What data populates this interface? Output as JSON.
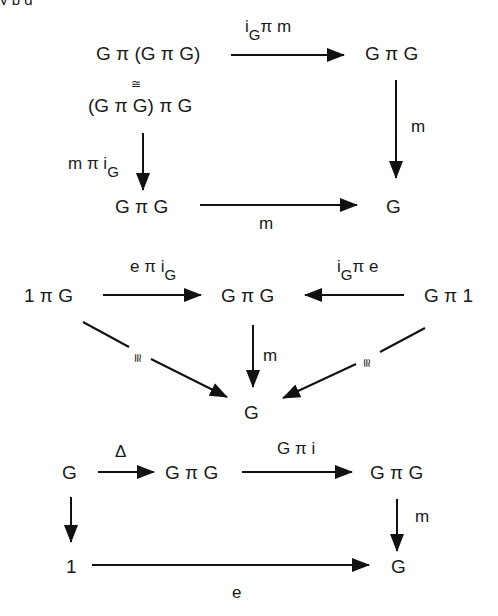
{
  "clipped_header_text": "y  p                                    g",
  "diagrams": [
    {
      "name": "associativity",
      "nodes": {
        "top_left": "G π (G π G)",
        "iso_symbol": "≅",
        "top_left_alt": "(G π G) π G",
        "top_right": "G π G",
        "bottom_left": "G π G",
        "bottom_right": "G"
      },
      "labels": {
        "top_arrow_main": "i",
        "top_arrow_sub": "G",
        "top_arrow_rest": "π  m",
        "right_arrow": "m",
        "left_arrow_main": "m π i",
        "left_arrow_sub": "G",
        "bottom_arrow": "m"
      }
    },
    {
      "name": "unit",
      "nodes": {
        "left": "1 π G",
        "center": "G π G",
        "right": "G π 1",
        "bottom": "G"
      },
      "labels": {
        "left_arrow_main": "e π i",
        "left_arrow_sub": "G",
        "right_arrow_main": "i",
        "right_arrow_sub": "G",
        "right_arrow_rest": "π e",
        "center_arrow": "m",
        "diag_left": "≅",
        "diag_right": "≅"
      }
    },
    {
      "name": "inverse",
      "nodes": {
        "top_left": "G",
        "top_mid": "G π G",
        "top_right": "G π G",
        "bottom_left": "1",
        "bottom_right": "G"
      },
      "labels": {
        "delta_arrow": "Δ",
        "mid_arrow": "G π i",
        "right_arrow": "m",
        "bottom_arrow": "e"
      }
    }
  ]
}
